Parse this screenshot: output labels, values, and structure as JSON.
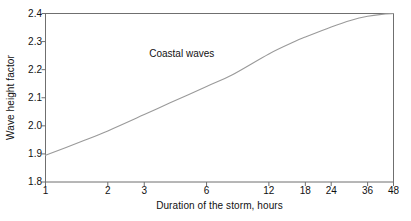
{
  "chart_data": {
    "type": "line",
    "title": "",
    "xlabel": "Duration of the storm, hours",
    "ylabel": "Wave height factor",
    "xscale": "log",
    "yscale": "linear",
    "xlim": [
      1,
      48
    ],
    "ylim": [
      1.8,
      2.4
    ],
    "grid": false,
    "legend": "none",
    "xticks": [
      1,
      2,
      3,
      6,
      12,
      18,
      24,
      36,
      48
    ],
    "xtick_labels": [
      "1",
      "2",
      "3",
      "6",
      "12",
      "18",
      "24",
      "36",
      "48"
    ],
    "yticks": [
      1.8,
      1.9,
      2.0,
      2.1,
      2.2,
      2.3,
      2.4
    ],
    "ytick_labels": [
      "1.8",
      "1.9",
      "2.0",
      "2.1",
      "2.2",
      "2.3",
      "2.4"
    ],
    "annotations": [
      {
        "text": "Coastal waves",
        "x": 3.0,
        "y": 2.255
      }
    ],
    "series": [
      {
        "name": "Coastal waves",
        "color": "#9a9a9a",
        "x": [
          1,
          1.5,
          2,
          3,
          4,
          6,
          8,
          12,
          16,
          18,
          24,
          30,
          36,
          42,
          48
        ],
        "y": [
          1.895,
          1.945,
          1.982,
          2.04,
          2.082,
          2.14,
          2.182,
          2.256,
          2.3,
          2.316,
          2.352,
          2.376,
          2.39,
          2.397,
          2.4
        ]
      }
    ]
  },
  "axis": {
    "y_title": "Wave height factor",
    "x_title": "Duration of the storm, hours"
  },
  "annotation": {
    "coastal_waves": "Coastal waves"
  },
  "colors": {
    "curve": "#9a9a9a",
    "frame": "#6f6f6f",
    "background": "#ffffff",
    "text": "#111111"
  }
}
